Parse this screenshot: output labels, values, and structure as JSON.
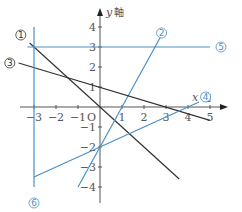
{
  "chart_data": {
    "type": "line",
    "title": "",
    "xlabel": "x 軸",
    "ylabel": "y 軸",
    "xlim": [
      -3.5,
      5.5
    ],
    "ylim": [
      -4.5,
      4.5
    ],
    "grid": false,
    "x_ticks": [
      {
        "value": -3,
        "label": "−3"
      },
      {
        "value": -2,
        "label": "−2"
      },
      {
        "value": -1,
        "label": "−1"
      },
      {
        "value": 1,
        "label": "1"
      },
      {
        "value": 2,
        "label": "2"
      },
      {
        "value": 3,
        "label": "3"
      },
      {
        "value": 4,
        "label": "4"
      },
      {
        "value": 5,
        "label": "5"
      }
    ],
    "y_ticks": [
      {
        "value": 4,
        "label": "4"
      },
      {
        "value": 3,
        "label": "3"
      },
      {
        "value": 2,
        "label": "2"
      },
      {
        "value": 1,
        "label": "1"
      },
      {
        "value": -1,
        "label": "−1"
      },
      {
        "value": -2,
        "label": "−2"
      },
      {
        "value": -3,
        "label": "−3"
      },
      {
        "value": -4,
        "label": "−4"
      }
    ],
    "origin_label": "O",
    "series": [
      {
        "name": "①",
        "equation": "y = -x",
        "color": "#333333",
        "points": [
          [
            -3.2,
            3.2
          ],
          [
            3.6,
            -3.6
          ]
        ],
        "label_pos": [
          -3.6,
          3.6
        ]
      },
      {
        "name": "②",
        "equation": "y = 2x - 2",
        "color": "#4a90c8",
        "points": [
          [
            -1.0,
            -4.0
          ],
          [
            2.75,
            3.5
          ]
        ],
        "label_pos": [
          2.8,
          3.7
        ]
      },
      {
        "name": "③",
        "equation": "y = -x/3 + 1",
        "color": "#333333",
        "points": [
          [
            -3.7,
            2.2
          ],
          [
            5.0,
            -0.67
          ]
        ],
        "label_pos": [
          -4.1,
          2.2
        ]
      },
      {
        "name": "④",
        "equation": "y = x/2 - 2",
        "color": "#4a90c8",
        "points": [
          [
            -3.0,
            -3.5
          ],
          [
            4.5,
            0.25
          ]
        ],
        "label_pos": [
          4.8,
          0.5
        ]
      },
      {
        "name": "⑤",
        "equation": "y = 3",
        "color": "#4a90c8",
        "points": [
          [
            -3.3,
            3.0
          ],
          [
            5.0,
            3.0
          ]
        ],
        "label_pos": [
          5.5,
          3.0
        ]
      },
      {
        "name": "⑥",
        "equation": "x = -3",
        "color": "#4a90c8",
        "points": [
          [
            -3.0,
            4.0
          ],
          [
            -3.0,
            -4.0
          ]
        ],
        "label_pos": [
          -3.0,
          -4.8
        ]
      }
    ]
  },
  "axes": {
    "x_title_var": "x",
    "x_title_kanji": "軸",
    "y_title_var": "y",
    "y_title_kanji": "軸",
    "origin": "O"
  },
  "colors": {
    "axis": "#555555",
    "dark_line": "#333333",
    "blue_line": "#4a90c8"
  }
}
